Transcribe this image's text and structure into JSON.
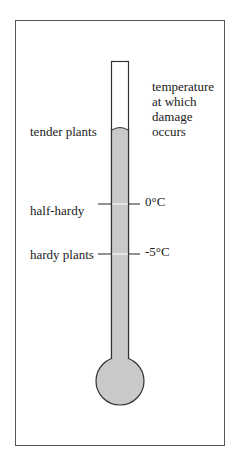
{
  "diagram": {
    "caption_lines": [
      "temperature",
      "at which",
      "damage",
      "occurs"
    ],
    "categories": [
      {
        "label": "tender plants"
      },
      {
        "label": "half-hardy",
        "temperature": "0°C"
      },
      {
        "label": "hardy plants",
        "temperature": "-5°C"
      }
    ],
    "colors": {
      "liquid": "#c9c9c9",
      "outline": "#333333",
      "frame": "#555555"
    }
  }
}
